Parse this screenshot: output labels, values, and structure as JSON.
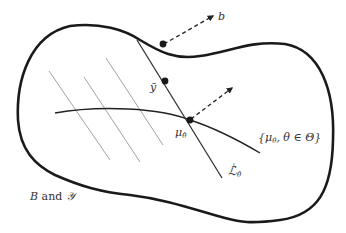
{
  "labels": {
    "b": "b",
    "y_bar": "ȳ",
    "mu_theta_hat": "μ",
    "mu_sub": "θ̂",
    "family_open": "{",
    "family_mu": "μ",
    "family_sub": "θ",
    "family_rest": ", θ ∈ Θ}",
    "L_perp_sup": "⊥",
    "L_letter": "ℒ",
    "L_sub": "θ̂",
    "space_B": "B",
    "space_and": " and ",
    "space_Y": "𝒴"
  },
  "colors": {
    "boundary": "#1a1a1a",
    "thin_lines": "#8a8a8a",
    "main_line": "#333333",
    "text": "#333333"
  }
}
